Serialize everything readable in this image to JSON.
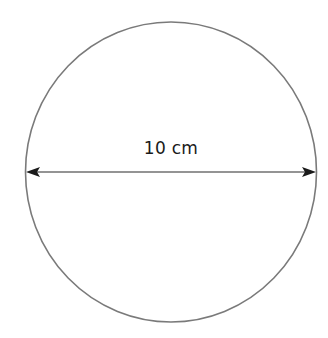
{
  "diagram": {
    "shape": "circle",
    "diameter_label": "10 cm",
    "measurement": "diameter",
    "colors": {
      "outline": "#7a7a7a",
      "arrow": "#1a1a1a",
      "text": "#1a1a1a",
      "background": "#ffffff"
    }
  }
}
